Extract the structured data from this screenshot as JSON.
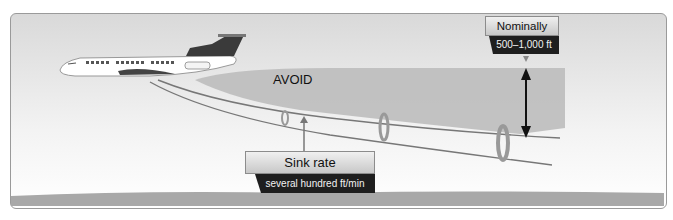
{
  "diagram": {
    "zone_label": "AVOID",
    "sink_rate": {
      "title": "Sink rate",
      "value": "several hundred ft/min"
    },
    "nominal": {
      "title": "Nominally",
      "value": "500–1,000 ft"
    },
    "colors": {
      "avoid_zone": "#bdbdbd",
      "label_dark": "#1e1e1e",
      "ground": "#a8a8a8",
      "sky_top": "#d9d9d9"
    }
  }
}
